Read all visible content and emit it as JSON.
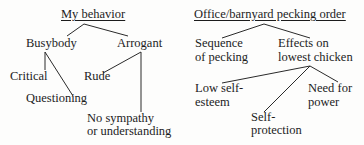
{
  "left_tree": {
    "title": "My behavior",
    "nodes": {
      "busybody": "Busybody",
      "arrogant": "Arrogant",
      "critical": "Critical",
      "questioning": "Questioning",
      "rude": "Rude",
      "no_sympathy_1": "No sympathy",
      "no_sympathy_2": "or understanding"
    }
  },
  "right_tree": {
    "title": "Office/barnyard pecking order",
    "nodes": {
      "sequence_1": "Sequence",
      "sequence_2": "of pecking",
      "effects_1": "Effects on",
      "effects_2": "lowest chicken",
      "low_self_1": "Low self-",
      "low_self_2": "esteem",
      "self_prot_1": "Self-",
      "self_prot_2": "protection",
      "need_1": "Need for",
      "need_2": "power"
    }
  }
}
